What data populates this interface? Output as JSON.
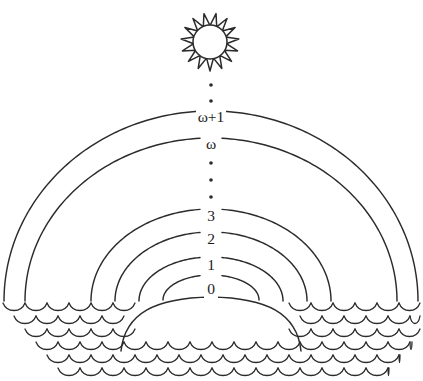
{
  "figure": {
    "background_color": "#ffffff",
    "ink_color": "#2b2b2b",
    "width": 423,
    "height": 381
  },
  "sun": {
    "name": "sun",
    "center_x": 210,
    "center_y": 42,
    "core_radius": 17,
    "ray_outer_radius": 29,
    "ray_count": 15
  },
  "arcs": [
    {
      "label": "0",
      "cx": 211,
      "cy": 300,
      "rx": 48,
      "ry": 25,
      "label_y": 290
    },
    {
      "label": "1",
      "cx": 211,
      "cy": 301,
      "rx": 72,
      "ry": 44,
      "label_y": 266
    },
    {
      "label": "2",
      "cx": 211,
      "cy": 301,
      "rx": 96,
      "ry": 69,
      "label_y": 240
    },
    {
      "label": "3",
      "cx": 211,
      "cy": 301,
      "rx": 120,
      "ry": 92,
      "label_y": 217
    },
    {
      "label": "ω",
      "cx": 211,
      "cy": 301,
      "rx": 186,
      "ry": 163,
      "label_y": 145
    },
    {
      "label": "ω+1",
      "cx": 211,
      "cy": 301,
      "rx": 207,
      "ry": 190,
      "label_y": 118
    }
  ],
  "ellipsis_upper": {
    "name": "vertical-ellipsis-upper",
    "x": 211,
    "dot_y": [
      85,
      101
    ],
    "dot_radius": 1.8,
    "meaning": "further ordinals above omega+1"
  },
  "ellipsis_lower": {
    "name": "vertical-ellipsis-lower",
    "x": 211,
    "dot_y": [
      163,
      180,
      197
    ],
    "dot_radius": 1.8,
    "meaning": "finite ordinals between 3 and omega"
  },
  "water": {
    "name": "water-waves",
    "top_y": 303,
    "row_spacing": 13,
    "row_count": 6,
    "scallop_width": 22,
    "scallop_depth": 10,
    "rows": [
      {
        "x_start": 3,
        "x_end": 420,
        "y": 303
      },
      {
        "x_start": 14,
        "x_end": 420,
        "y": 316
      },
      {
        "x_start": 25,
        "x_end": 420,
        "y": 329
      },
      {
        "x_start": 36,
        "x_end": 412,
        "y": 342
      },
      {
        "x_start": 47,
        "x_end": 400,
        "y": 355
      },
      {
        "x_start": 58,
        "x_end": 389,
        "y": 368
      }
    ]
  },
  "island": {
    "name": "submerged-dome",
    "cx": 211,
    "cy": 301,
    "rx": 90,
    "ry": 50,
    "note": "the 0 arc continues as a dome below the waterline"
  }
}
